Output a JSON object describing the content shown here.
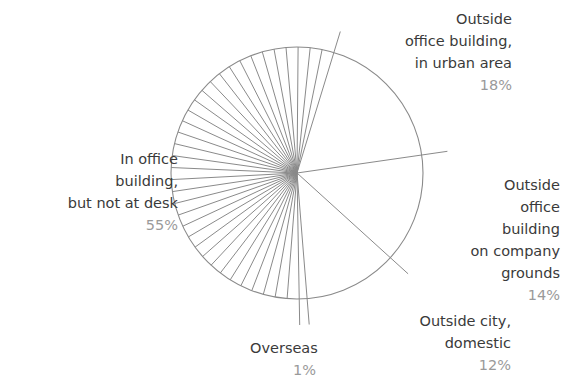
{
  "chart_data": {
    "type": "pie",
    "title": "",
    "style": "outline with leader lines; largest slice hatched with radial lines",
    "start_angle_deg_clockwise_from_top": 17,
    "slices": [
      {
        "label": "Outside office building, in urban area",
        "value": 18,
        "display": "18%"
      },
      {
        "label": "Outside office building on company grounds",
        "value": 14,
        "display": "14%"
      },
      {
        "label": "Outside city, domestic",
        "value": 12,
        "display": "12%"
      },
      {
        "label": "Overseas",
        "value": 1,
        "display": "1%"
      },
      {
        "label": "In office building, but not at desk",
        "value": 55,
        "display": "55%"
      }
    ],
    "colors": {
      "stroke": "#8a8a8a",
      "label_text": "#3a3a3a",
      "percent_text": "#9a9a9a"
    }
  },
  "labels": {
    "urban": {
      "name": "Outside\noffice building,\nin urban area",
      "pct": "18%"
    },
    "grounds": {
      "name": "Outside\noffice\nbuilding\non company\ngrounds",
      "pct": "14%"
    },
    "domestic": {
      "name": "Outside city,\ndomestic",
      "pct": "12%"
    },
    "overseas": {
      "name": "Overseas",
      "pct": "1%"
    },
    "office": {
      "name": "In office\nbuilding,\nbut not at desk",
      "pct": "55%"
    }
  }
}
